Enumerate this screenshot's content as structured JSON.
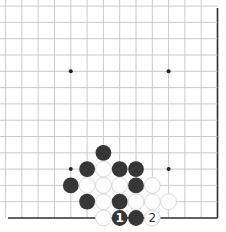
{
  "board": {
    "size": 19,
    "visible_columns": [
      7,
      19
    ],
    "visible_rows": [
      1,
      14
    ],
    "visible_region": "bottom-right corner",
    "colors": {
      "grid": "#c4c4c4",
      "edge": "#2e2e2e",
      "black_stone": "#363636",
      "white_stone": "#ffffff",
      "white_stone_outline": "#cfcfcf"
    },
    "hoshi": [
      {
        "col": 10,
        "row": 10
      },
      {
        "col": 16,
        "row": 10
      },
      {
        "col": 10,
        "row": 4
      },
      {
        "col": 16,
        "row": 4
      }
    ],
    "stones": [
      {
        "color": "black",
        "col": 12,
        "row": 5,
        "label": ""
      },
      {
        "color": "black",
        "col": 11,
        "row": 4,
        "label": ""
      },
      {
        "color": "white",
        "col": 12,
        "row": 4,
        "label": ""
      },
      {
        "color": "black",
        "col": 13,
        "row": 4,
        "label": ""
      },
      {
        "color": "black",
        "col": 14,
        "row": 4,
        "label": ""
      },
      {
        "color": "black",
        "col": 10,
        "row": 3,
        "label": ""
      },
      {
        "color": "white",
        "col": 11,
        "row": 3,
        "label": ""
      },
      {
        "color": "white",
        "col": 12,
        "row": 3,
        "label": ""
      },
      {
        "color": "white",
        "col": 13,
        "row": 3,
        "label": ""
      },
      {
        "color": "black",
        "col": 14,
        "row": 3,
        "label": ""
      },
      {
        "color": "white",
        "col": 15,
        "row": 3,
        "label": ""
      },
      {
        "color": "black",
        "col": 11,
        "row": 2,
        "label": ""
      },
      {
        "color": "white",
        "col": 12,
        "row": 2,
        "label": ""
      },
      {
        "color": "black",
        "col": 13,
        "row": 2,
        "label": ""
      },
      {
        "color": "white",
        "col": 14,
        "row": 2,
        "label": ""
      },
      {
        "color": "white",
        "col": 15,
        "row": 2,
        "label": ""
      },
      {
        "color": "white",
        "col": 16,
        "row": 2,
        "label": ""
      },
      {
        "color": "white",
        "col": 12,
        "row": 1,
        "label": ""
      },
      {
        "color": "black",
        "col": 13,
        "row": 1,
        "label": "1"
      },
      {
        "color": "black",
        "col": 14,
        "row": 1,
        "label": ""
      },
      {
        "color": "white",
        "col": 15,
        "row": 1,
        "label": "2"
      }
    ],
    "move_labels": {
      "move_1": "1",
      "move_2": "2"
    }
  }
}
